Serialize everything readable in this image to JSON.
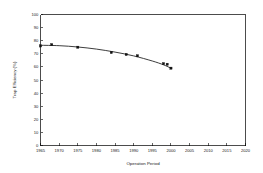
{
  "chart_data": {
    "type": "scatter",
    "title": "",
    "xlabel": "Operation Period",
    "ylabel": "Trap Efficiency (%)",
    "xlim": [
      1965,
      2020
    ],
    "ylim": [
      0,
      100
    ],
    "grid": false,
    "legend": "none",
    "x_ticks": [
      1965,
      1970,
      1975,
      1980,
      1985,
      1990,
      1995,
      2000,
      2005,
      2010,
      2015,
      2020
    ],
    "x_tick_labels": [
      "1965",
      "1970",
      "1975",
      "1980",
      "1985",
      "1990",
      "1995",
      "2000",
      "2005",
      "2010",
      "2015",
      "2020"
    ],
    "y_ticks": [
      0,
      10,
      20,
      30,
      40,
      50,
      60,
      70,
      80,
      90,
      100
    ],
    "y_tick_labels": [
      "0",
      "10",
      "20",
      "30",
      "40",
      "50",
      "60",
      "70",
      "80",
      "90",
      "100"
    ],
    "series": [
      {
        "name": "Trap Efficiency",
        "marker": "square",
        "x": [
          1965,
          1968,
          1975,
          1984,
          1988,
          1991,
          1998,
          1999,
          2000
        ],
        "values": [
          76,
          77,
          75,
          71,
          69.5,
          68.5,
          62.5,
          62,
          59
        ]
      },
      {
        "name": "Fitted Trend",
        "type": "line",
        "x": [
          1965,
          1970,
          1975,
          1980,
          1985,
          1990,
          1995,
          1998,
          2000
        ],
        "values": [
          76.5,
          76.2,
          75.2,
          73.6,
          71.3,
          68.4,
          64.5,
          61.6,
          59.0
        ]
      }
    ],
    "annotations": []
  },
  "axes": {
    "x_title": "Operation Period",
    "y_title": "Trap Efficiency (%)"
  },
  "colors": {
    "axis": "#000000",
    "marker": "#111111",
    "curve": "#1a1a1a",
    "background": "#ffffff"
  }
}
